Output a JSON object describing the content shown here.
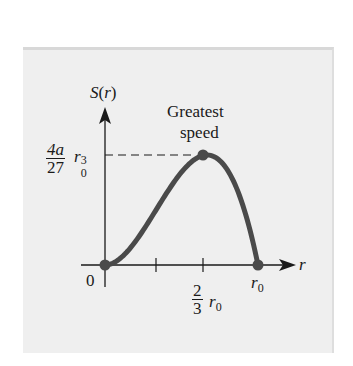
{
  "chart_data": {
    "type": "line",
    "title": "",
    "xlabel": "r",
    "ylabel": "S(r)",
    "function": "S(r) = a r^2 (r0 - r)",
    "x_ticks": [
      {
        "value": 0,
        "label": "0"
      },
      {
        "value": 0.3333,
        "label": ""
      },
      {
        "value": 0.6667,
        "label": "2/3 r0"
      },
      {
        "value": 1.0,
        "label": "r0"
      }
    ],
    "y_ticks": [
      {
        "value": 0.148148,
        "label": "4a/27 r0^3"
      }
    ],
    "series": [
      {
        "name": "S(r)",
        "x": [
          0,
          0.1,
          0.2,
          0.3,
          0.4,
          0.5,
          0.6,
          0.6667,
          0.7,
          0.8,
          0.9,
          1.0
        ],
        "y": [
          0,
          0.009,
          0.032,
          0.063,
          0.096,
          0.125,
          0.144,
          0.148148,
          0.147,
          0.128,
          0.081,
          0
        ]
      }
    ],
    "highlighted_points": [
      {
        "x": 0,
        "y": 0,
        "label": "origin"
      },
      {
        "x": 0.6667,
        "y": 0.148148,
        "label": "Greatest speed"
      },
      {
        "x": 1.0,
        "y": 0,
        "label": "r0"
      }
    ],
    "annotations": [
      "Greatest speed"
    ],
    "guide_lines": [
      {
        "type": "dashed-horizontal",
        "y": 0.148148,
        "from_x": 0,
        "to_x": 0.6667
      }
    ],
    "xlim": [
      0,
      1.0
    ],
    "ylim": [
      0,
      0.148148
    ],
    "grid": false,
    "legend": "none",
    "curve_color": "#4a4a4a"
  },
  "labels": {
    "y_axis": "S",
    "y_axis_paren_open": "(",
    "y_axis_var": "r",
    "y_axis_paren_close": ")",
    "x_axis": "r",
    "origin": "0",
    "annotation_line1": "Greatest",
    "annotation_line2": "speed",
    "ymax_num": "4a",
    "ymax_den": "27",
    "ymax_var": "r",
    "ymax_sub": "0",
    "ymax_sup": "3",
    "xpeak_num": "2",
    "xpeak_den": "3",
    "xpeak_var": "r",
    "xpeak_sub": "0",
    "xend_var": "r",
    "xend_sub": "0"
  }
}
